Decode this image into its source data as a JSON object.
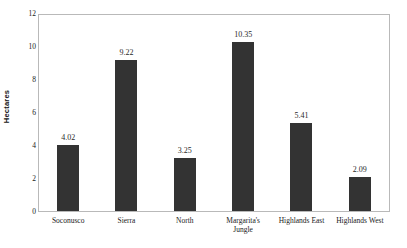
{
  "chart_data": {
    "type": "bar",
    "title": "",
    "subtitle": "",
    "xlabel": "",
    "ylabel": "Hectares",
    "ylim": [
      0,
      12
    ],
    "yticks": [
      0,
      2,
      4,
      6,
      8,
      10,
      12
    ],
    "ytick_labels": [
      "0",
      "2",
      "4",
      "6",
      "8",
      "10",
      "12"
    ],
    "grid": false,
    "legend": null,
    "bar_color": "#333333",
    "frame_color": "#b9b9b9",
    "background": "#ffffff",
    "categories": [
      "Soconusco",
      "Sierra",
      "North",
      "Margarita's Jungle",
      "Highlands East",
      "Highlands West"
    ],
    "category_lines": [
      [
        "Soconusco"
      ],
      [
        "Sierra"
      ],
      [
        "North"
      ],
      [
        "Margarita's",
        "Jungle"
      ],
      [
        "Highlands East"
      ],
      [
        "Highlands West"
      ]
    ],
    "values": [
      4.02,
      9.22,
      3.25,
      10.35,
      5.41,
      2.09
    ],
    "value_labels": [
      "4.02",
      "9.22",
      "3.25",
      "10.35",
      "5.41",
      "2.09"
    ]
  }
}
